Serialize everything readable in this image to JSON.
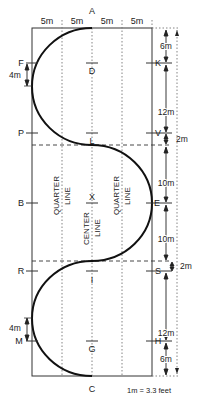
{
  "diagram": {
    "colors": {
      "line": "#333333",
      "path": "#111111",
      "dotted": "#777777",
      "background": "#ffffff"
    },
    "top_widths": [
      "5m",
      "5m",
      "5m",
      "5m"
    ],
    "letters": {
      "A": "A",
      "C": "C",
      "F": "F",
      "K": "K",
      "D": "D",
      "G": "G",
      "P": "P",
      "V": "V",
      "L": "L",
      "B": "B",
      "E": "E",
      "X": "X",
      "R": "R",
      "S": "S",
      "I": "I",
      "M": "M",
      "H": "H"
    },
    "lines": {
      "quarter_left_1": "QUARTER",
      "quarter_left_2": "LINE",
      "center_1": "CENTER",
      "center_2": "LINE",
      "quarter_right_1": "QUARTER",
      "quarter_right_2": "LINE"
    },
    "dimensions": {
      "top_6m": "6m",
      "upper_12m": "12m",
      "upper_2m": "2m",
      "mid_upper_10m": "10m",
      "mid_lower_10m": "10m",
      "lower_2m": "2m",
      "lower_12m": "12m",
      "bottom_6m": "6m",
      "F_4m": "4m",
      "M_4m": "4m"
    },
    "scale_note": "1m = 3.3 feet"
  }
}
